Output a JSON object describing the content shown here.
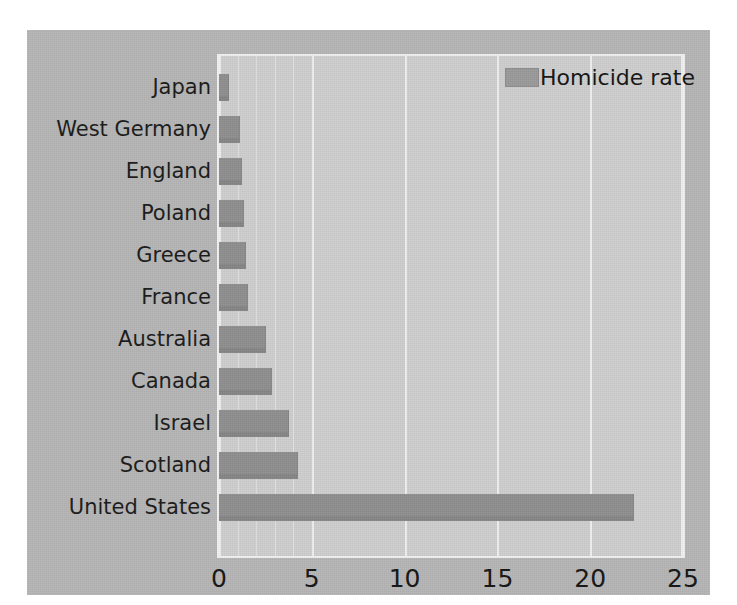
{
  "chart_data": {
    "type": "bar",
    "orientation": "horizontal",
    "title": "",
    "xlabel": "",
    "ylabel": "",
    "categories": [
      "Japan",
      "West Germany",
      "England",
      "Poland",
      "Greece",
      "France",
      "Australia",
      "Canada",
      "Israel",
      "Scotland",
      "United States"
    ],
    "series": [
      {
        "name": "Homicide rate",
        "values": [
          0.5,
          1.1,
          1.2,
          1.3,
          1.4,
          1.5,
          2.5,
          2.8,
          3.7,
          4.2,
          22.3
        ]
      }
    ],
    "xlim": [
      0,
      25
    ],
    "xticks": [
      0,
      5,
      10,
      15,
      20,
      25
    ],
    "xtick_labels": [
      "0",
      "5",
      "10",
      "15",
      "20",
      "25"
    ],
    "minor_gridlines": [
      1,
      2,
      3,
      4
    ],
    "grid": true,
    "legend": {
      "position": "top-right",
      "entries": [
        {
          "label": "Homicide rate",
          "color": "#9b9b9b"
        }
      ]
    },
    "colors": {
      "bar": "#8f8f8f",
      "plot_background": "#cfcfcf",
      "figure_background": "#b6b6b6",
      "gridline": "#f0f0f0",
      "text": "#151515"
    }
  }
}
